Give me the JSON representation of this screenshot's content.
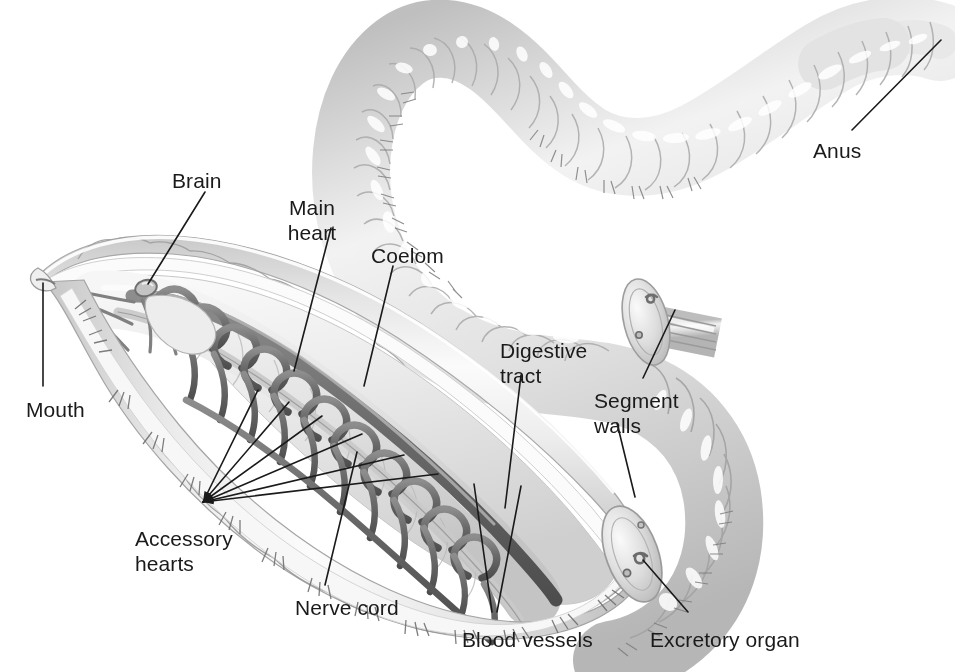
{
  "figure": {
    "background_color": "#ffffff",
    "line_color": "#1a1a1a",
    "body_color": "#d8d8d8",
    "body_light": "#f3f3f3",
    "vessel_color": "#6f6f6f",
    "vessel_dark": "#4a4a4a",
    "cavity_color": "#e9e9e9"
  },
  "labels": [
    {
      "id": "brain",
      "text": "Brain",
      "x": 172,
      "y": 168,
      "align": "left"
    },
    {
      "id": "main-heart",
      "text": "Main\nheart",
      "x": 312,
      "y": 195,
      "align": "center"
    },
    {
      "id": "coelom",
      "text": "Coelom",
      "x": 371,
      "y": 243,
      "align": "left"
    },
    {
      "id": "anus",
      "text": "Anus",
      "x": 813,
      "y": 138,
      "align": "left"
    },
    {
      "id": "digestive-tract",
      "text": "Digestive\ntract",
      "x": 500,
      "y": 338,
      "align": "left"
    },
    {
      "id": "segment-walls",
      "text": "Segment\nwalls",
      "x": 594,
      "y": 388,
      "align": "left"
    },
    {
      "id": "mouth",
      "text": "Mouth",
      "x": 26,
      "y": 397,
      "align": "left"
    },
    {
      "id": "accessory-hearts",
      "text": "Accessory\nhearts",
      "x": 135,
      "y": 526,
      "align": "left"
    },
    {
      "id": "nerve-cord",
      "text": "Nerve cord",
      "x": 295,
      "y": 595,
      "align": "left"
    },
    {
      "id": "blood-vessels",
      "text": "Blood vessels",
      "x": 462,
      "y": 627,
      "align": "left"
    },
    {
      "id": "excretory-organ",
      "text": "Excretory organ",
      "x": 650,
      "y": 627,
      "align": "left"
    }
  ],
  "leaders": [
    {
      "id": "brain-leader",
      "points": "205,192 148,284"
    },
    {
      "id": "main-heart-leader",
      "points": "331,228 294,371"
    },
    {
      "id": "coelom-leader",
      "points": "393,266 364,386"
    },
    {
      "id": "anus-leader",
      "points": "852,130 941,40"
    },
    {
      "id": "digestive-tract-leader",
      "points": "521,375 505,508"
    },
    {
      "id": "segment-walls-leader",
      "points": "643,378 675,310"
    },
    {
      "id": "segment-walls-leader-2",
      "points": "617,423 635,497"
    },
    {
      "id": "mouth-leader",
      "points": "43,386 43,283"
    },
    {
      "id": "nerve-cord-leader",
      "points": "325,585 357,452"
    },
    {
      "id": "blood-vessels-leader-a",
      "points": "492,612 474,484"
    },
    {
      "id": "blood-vessels-leader-b",
      "points": "497,612 521,486"
    },
    {
      "id": "excretory-organ-leader",
      "points": "688,612 643,560"
    },
    {
      "id": "accessory-hearts-fan-1",
      "points": "203,502 258,390"
    },
    {
      "id": "accessory-hearts-fan-2",
      "points": "203,502 289,402"
    },
    {
      "id": "accessory-hearts-fan-3",
      "points": "203,502 322,416"
    },
    {
      "id": "accessory-hearts-fan-4",
      "points": "203,502 362,434"
    },
    {
      "id": "accessory-hearts-fan-5",
      "points": "203,502 404,455"
    },
    {
      "id": "accessory-hearts-fan-6",
      "points": "203,502 438,474"
    }
  ],
  "anatomy_parts": [
    "head with mouth at anterior tip",
    "brain (cerebral ganglion) dorsal bulb",
    "dorsal vessel / main heart",
    "looped accessory hearts (aortic arches)",
    "ventral nerve cord",
    "digestive tract running through body",
    "coelom (body cavity)",
    "segment walls (septa) shown in cut-away",
    "excretory organ (nephridium)",
    "lateral blood vessels",
    "posterior body with anus"
  ]
}
